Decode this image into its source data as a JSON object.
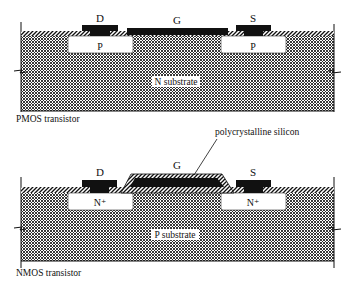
{
  "figures": [
    {
      "id": "pmos",
      "caption": "PMOS transistor",
      "substrate_label": "N substrate",
      "terminals": {
        "drain": "D",
        "gate": "G",
        "source": "S"
      },
      "diffusion_labels": {
        "left": "P",
        "right": "P"
      }
    },
    {
      "id": "nmos",
      "caption": "NMOS transistor",
      "substrate_label": "P substrate",
      "terminals": {
        "drain": "D",
        "gate": "G",
        "source": "S"
      },
      "diffusion_labels": {
        "left": "N⁺",
        "right": "N⁺"
      },
      "callout": "polycrystalline silicon"
    }
  ],
  "colors": {
    "ink": "#111111",
    "background": "#ffffff"
  }
}
